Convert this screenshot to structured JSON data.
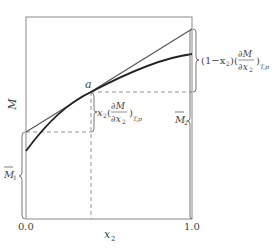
{
  "diagram": {
    "y_axis_label": "M",
    "x_axis_label": "x2",
    "x_axis_label_sub": "2",
    "x_ticks": [
      "0.0",
      "1.0"
    ],
    "point_label": "a",
    "annotations": {
      "m1_bar": "M̅₁",
      "m2_bar": "M̅₂",
      "m1_main": "M",
      "m1_sub": "1",
      "m2_main": "M",
      "m2_sub": "2",
      "mid_prefix": "x",
      "mid_prefix_sub": "2",
      "right_prefix": "(1−x",
      "right_prefix_sub": "2",
      "right_prefix_close": ")",
      "frac_num": "∂M",
      "frac_den": "∂x",
      "frac_den_sub": "2",
      "open_paren": "(",
      "close_paren": ")",
      "subscript_Tp": "T,p"
    },
    "colors": {
      "line": "#555555",
      "curve": "#222222",
      "dash": "#888888",
      "frame": "#777777",
      "text": "#444444"
    }
  }
}
